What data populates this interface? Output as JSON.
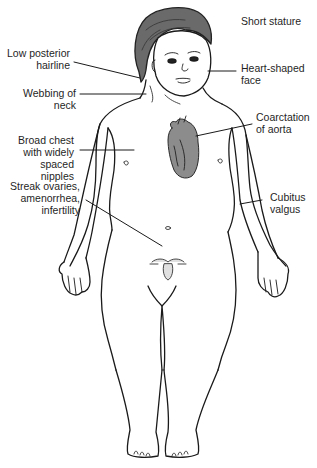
{
  "figure": {
    "colors": {
      "line": "#1a1a1a",
      "skin": "#ffffff",
      "hair": "#5a5a5a",
      "heart": "#8a8a8a",
      "heart_dark": "#4a4a4a",
      "background": "#ffffff"
    }
  },
  "labels": {
    "short_stature": "Short stature",
    "low_posterior_hairline": "Low posterior\nhairline",
    "heart_shaped_face": "Heart-shaped\nface",
    "webbing_of_neck": "Webbing of\nneck",
    "coarctation_of_aorta": "Coarctation\nof aorta",
    "broad_chest": "Broad chest\nwith widely\nspaced\nnipples",
    "streak_ovaries": "Streak ovaries,\namenorrhea,\ninfertility",
    "cubitus_valgus": "Cubitus\nvalgus"
  }
}
